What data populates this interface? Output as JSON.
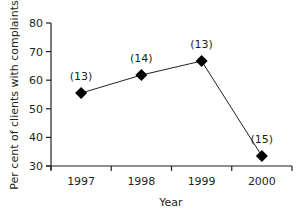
{
  "chart_data": {
    "type": "line",
    "title": "",
    "xlabel": "Year",
    "ylabel": "Per cent of clients with complaints",
    "categories": [
      "1997",
      "1998",
      "1999",
      "2000"
    ],
    "series": [
      {
        "name": "Per cent of clients with complaints",
        "values": [
          55.5,
          61.8,
          66.7,
          33.5
        ],
        "annotations": [
          "(13)",
          "(14)",
          "(13)",
          "(15)"
        ],
        "marker": "diamond",
        "color": "#000000"
      }
    ],
    "ylim": [
      30,
      80
    ],
    "yticks": [
      30,
      40,
      50,
      60,
      70,
      80
    ],
    "ytick_labels": [
      "30",
      "40",
      "50",
      "60",
      "70",
      "80"
    ],
    "grid": false,
    "legend": null
  },
  "colors": {
    "axis": "#231f20",
    "line": "#231f20",
    "marker": "#000000"
  }
}
